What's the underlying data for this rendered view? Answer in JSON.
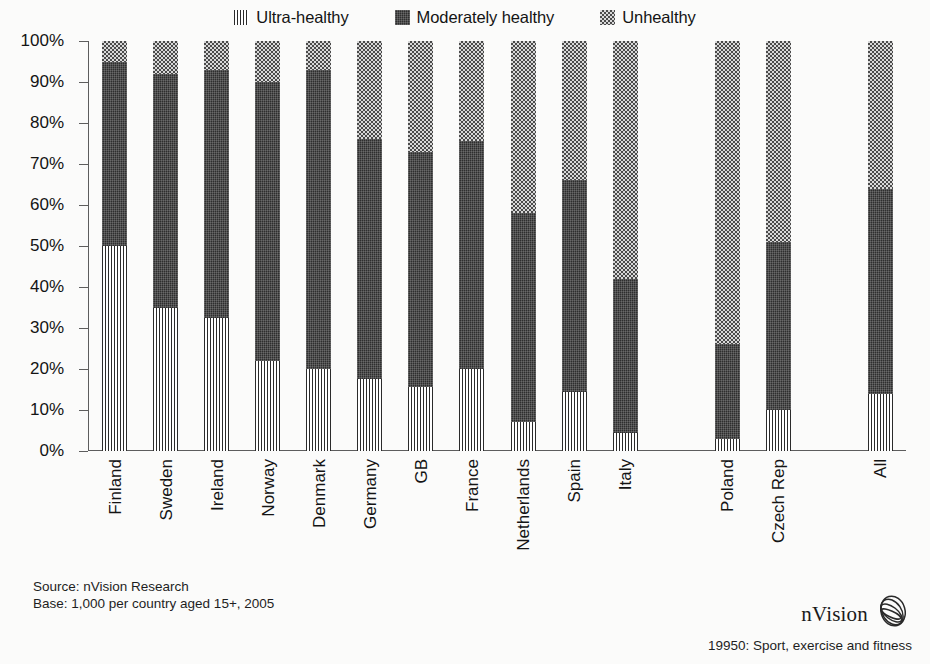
{
  "legend": {
    "items": [
      {
        "label": "Ultra-healthy",
        "icon": "pattern-vertical-lines-swatch",
        "pattern": "ultra",
        "color": "#2b2b2b"
      },
      {
        "label": "Moderately healthy",
        "icon": "pattern-dark-weave-swatch",
        "pattern": "moderate",
        "color": "#2e2e2e"
      },
      {
        "label": "Unhealthy",
        "icon": "pattern-gray-checker-swatch",
        "pattern": "unhealthy",
        "color": "#8d8d8d"
      }
    ]
  },
  "footer": {
    "source": "Source: nVision Research",
    "base": "Base: 1,000 per country aged 15+, 2005",
    "brand_name": "nVision",
    "brand_icon": "nvision-ellipse-logo",
    "caption": "19950: Sport, exercise and fitness"
  },
  "chart_data": {
    "type": "bar",
    "title": "",
    "subtitle": "",
    "xlabel": "",
    "ylabel": "",
    "stacked": true,
    "stack_total": 100,
    "ylim": [
      0,
      100
    ],
    "grid": false,
    "legend_position": "top-center",
    "ytick_labels": [
      "0%",
      "10%",
      "20%",
      "30%",
      "40%",
      "50%",
      "60%",
      "70%",
      "80%",
      "90%",
      "100%"
    ],
    "ytick_values": [
      0,
      10,
      20,
      30,
      40,
      50,
      60,
      70,
      80,
      90,
      100
    ],
    "categories": [
      "Finland",
      "Sweden",
      "Ireland",
      "Norway",
      "Denmark",
      "Germany",
      "GB",
      "France",
      "Netherlands",
      "Spain",
      "Italy",
      "Poland",
      "Czech Rep",
      "All"
    ],
    "category_gaps_after": [
      "Italy",
      "Czech Rep"
    ],
    "series": [
      {
        "name": "Ultra-healthy",
        "pattern": "ultra",
        "values": [
          50,
          35,
          32.5,
          22,
          20,
          17.5,
          15.5,
          20,
          7,
          14.5,
          4.5,
          3,
          10,
          14
        ]
      },
      {
        "name": "Moderately healthy",
        "pattern": "moderate",
        "values": [
          45,
          57,
          60.5,
          68,
          73,
          58.5,
          57.5,
          55.5,
          51,
          51.5,
          37.5,
          23,
          41,
          50
        ]
      },
      {
        "name": "Unhealthy",
        "pattern": "unhealthy",
        "values": [
          5,
          8,
          7,
          10,
          7,
          24,
          27,
          24.5,
          42,
          34,
          58,
          74,
          49,
          36
        ]
      }
    ]
  }
}
